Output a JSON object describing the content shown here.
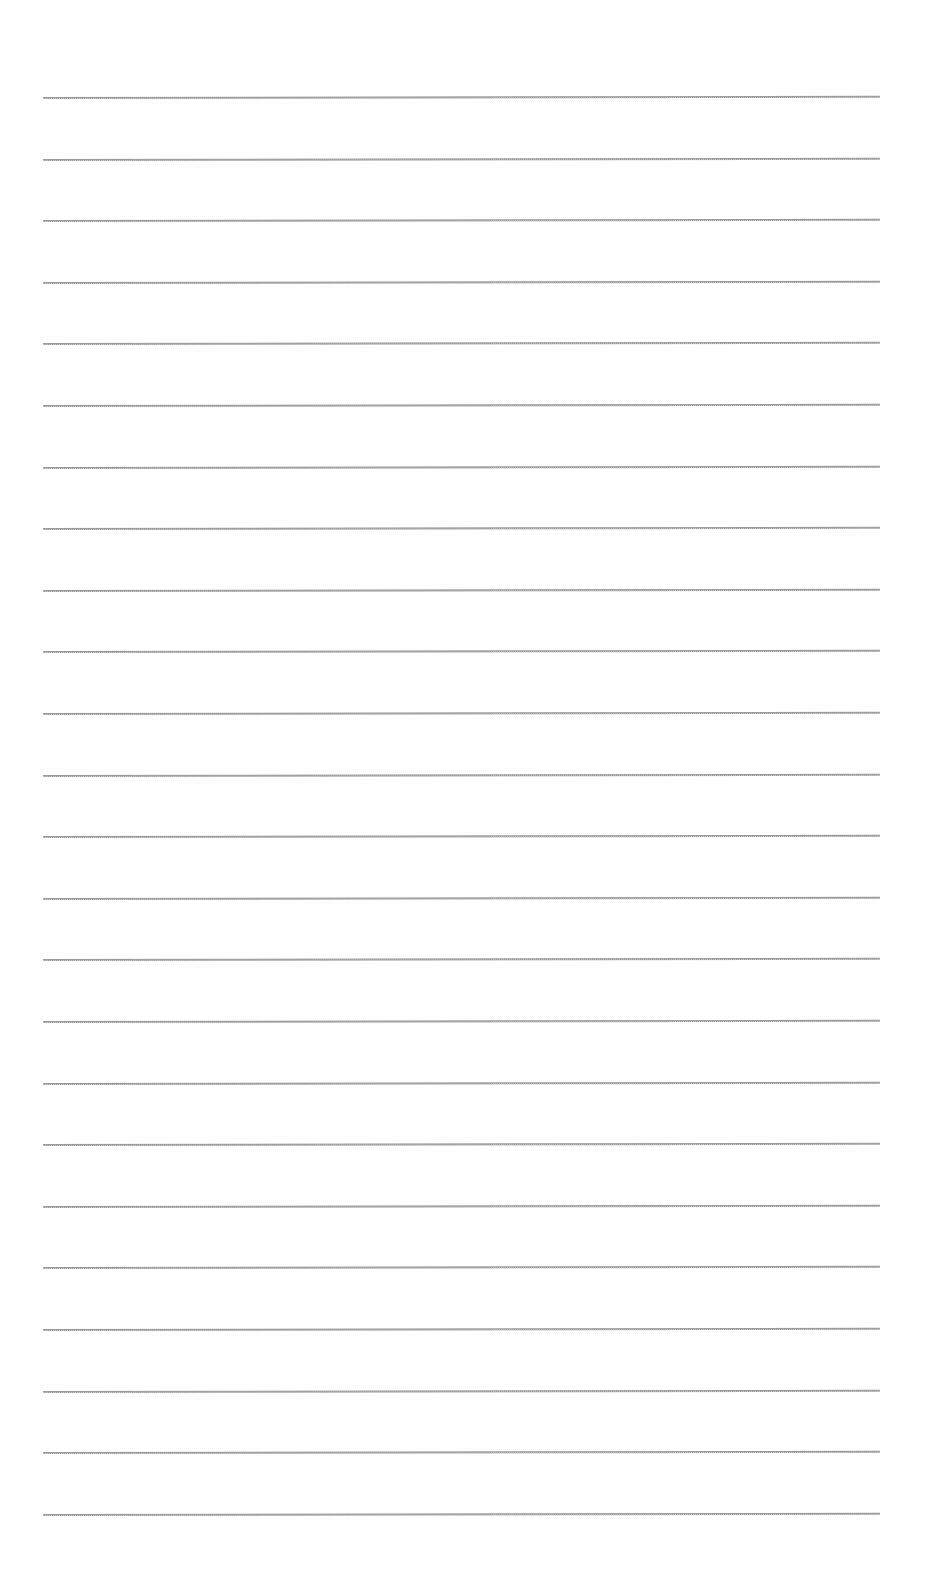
{
  "page": {
    "type": "lined-paper",
    "background": "#fefefe",
    "rule_color": "#9a9a9a",
    "line_count": 24,
    "first_line_y": 97,
    "line_spacing": 61.6,
    "line_left_x": 43,
    "line_right_x": 880,
    "text_content": []
  }
}
